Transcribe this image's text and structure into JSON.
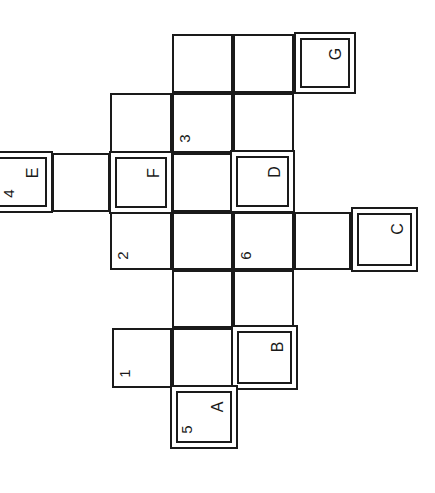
{
  "puzzle": {
    "type": "crossword-grid",
    "orientation": "rotated-90-ccw",
    "cells": [
      {
        "x": 172,
        "y": 34,
        "w": 61,
        "h": 59,
        "double": false,
        "num": "",
        "letter": ""
      },
      {
        "x": 233,
        "y": 34,
        "w": 61,
        "h": 59,
        "double": false,
        "num": "",
        "letter": ""
      },
      {
        "x": 294,
        "y": 32,
        "w": 62,
        "h": 62,
        "double": true,
        "num": "",
        "letter": "G"
      },
      {
        "x": 110,
        "y": 93,
        "w": 62,
        "h": 60,
        "double": false,
        "num": "",
        "letter": ""
      },
      {
        "x": 172,
        "y": 93,
        "w": 61,
        "h": 60,
        "double": false,
        "num": "3",
        "letter": ""
      },
      {
        "x": 233,
        "y": 93,
        "w": 61,
        "h": 60,
        "double": false,
        "num": "",
        "letter": ""
      },
      {
        "x": -8,
        "y": 151,
        "w": 61,
        "h": 62,
        "double": true,
        "num": "4",
        "letter": "E"
      },
      {
        "x": 52,
        "y": 153,
        "w": 58,
        "h": 59,
        "double": false,
        "num": "",
        "letter": ""
      },
      {
        "x": 109,
        "y": 151,
        "w": 64,
        "h": 63,
        "double": true,
        "num": "",
        "letter": "F"
      },
      {
        "x": 172,
        "y": 153,
        "w": 61,
        "h": 59,
        "double": false,
        "num": "",
        "letter": ""
      },
      {
        "x": 230,
        "y": 150,
        "w": 65,
        "h": 63,
        "double": true,
        "num": "",
        "letter": "D"
      },
      {
        "x": 110,
        "y": 212,
        "w": 62,
        "h": 58,
        "double": false,
        "num": "2",
        "letter": ""
      },
      {
        "x": 172,
        "y": 212,
        "w": 61,
        "h": 58,
        "double": false,
        "num": "",
        "letter": ""
      },
      {
        "x": 233,
        "y": 212,
        "w": 61,
        "h": 58,
        "double": false,
        "num": "6",
        "letter": ""
      },
      {
        "x": 294,
        "y": 212,
        "w": 57,
        "h": 58,
        "double": false,
        "num": "",
        "letter": ""
      },
      {
        "x": 351,
        "y": 207,
        "w": 67,
        "h": 65,
        "double": true,
        "num": "",
        "letter": "C"
      },
      {
        "x": 172,
        "y": 270,
        "w": 61,
        "h": 58,
        "double": false,
        "num": "",
        "letter": ""
      },
      {
        "x": 233,
        "y": 270,
        "w": 61,
        "h": 58,
        "double": false,
        "num": "",
        "letter": ""
      },
      {
        "x": 112,
        "y": 328,
        "w": 60,
        "h": 60,
        "double": false,
        "num": "1",
        "letter": ""
      },
      {
        "x": 172,
        "y": 328,
        "w": 61,
        "h": 60,
        "double": false,
        "num": "",
        "letter": ""
      },
      {
        "x": 231,
        "y": 325,
        "w": 67,
        "h": 65,
        "double": true,
        "num": "",
        "letter": "B"
      },
      {
        "x": 170,
        "y": 385,
        "w": 68,
        "h": 64,
        "double": true,
        "num": "5",
        "letter": "A"
      }
    ]
  }
}
